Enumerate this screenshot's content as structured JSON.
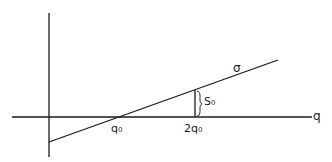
{
  "diagram": {
    "axes": {
      "x_label": "q",
      "y_label": ""
    },
    "line_label": "σ",
    "ticks": [
      {
        "label": "q₀"
      },
      {
        "label": "2q₀"
      }
    ],
    "brace_label": "S₀",
    "colors": {
      "ink": "#1a1a1a",
      "background": "#ffffff"
    }
  }
}
